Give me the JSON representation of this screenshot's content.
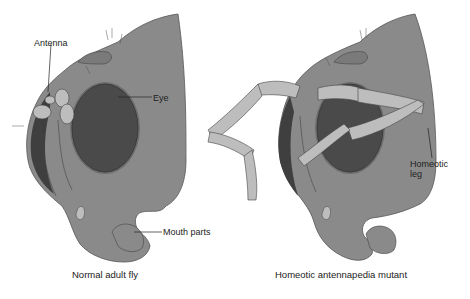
{
  "figure": {
    "panels": [
      {
        "id": "normal",
        "caption": "Normal adult fly",
        "labels": {
          "antenna": "Antenna",
          "eye": "Eye",
          "mouth_parts": "Mouth parts"
        }
      },
      {
        "id": "mutant",
        "caption": "Homeotic antennapedia mutant",
        "labels": {
          "homeotic_leg_line1": "Homeotic",
          "homeotic_leg_line2": "leg"
        }
      }
    ],
    "colors": {
      "head": "#8a8a8a",
      "eye": "#4a4a4a",
      "eye_rim": "#6e6e6e",
      "appendage": "#bdbdbd",
      "outline": "#333333",
      "background": "#ffffff"
    }
  }
}
